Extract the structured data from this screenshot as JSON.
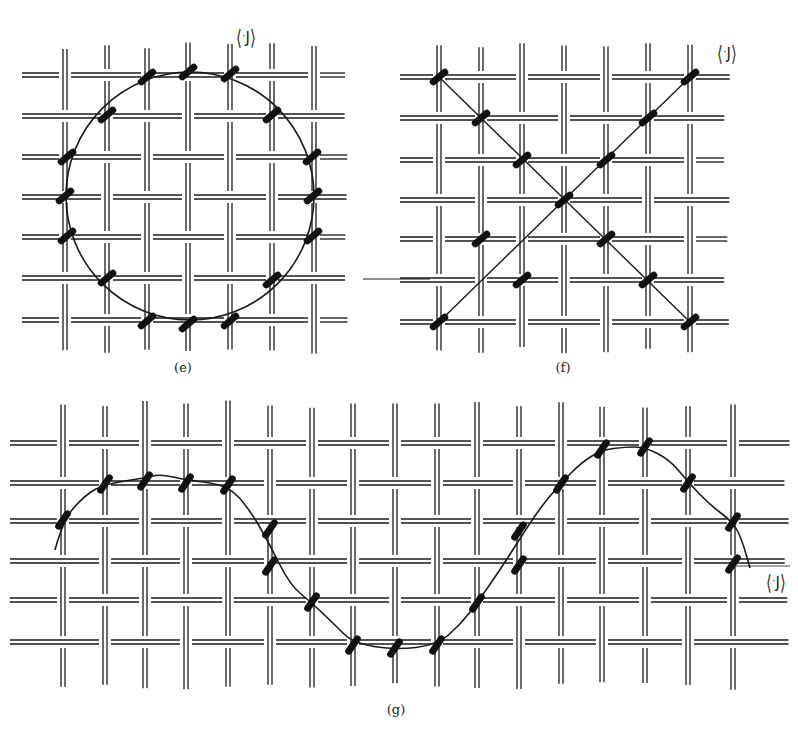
{
  "figure": {
    "colors": {
      "line": "#1a1a1a",
      "stitch": "#111111",
      "background": "#ffffff"
    },
    "panels": [
      {
        "id": "e",
        "caption": "(e)",
        "caption_pos": [
          183,
          370
        ],
        "shape": "circle",
        "path_label": {
          "prefix": "⟨",
          "dot": "·",
          "letter": "J",
          "suffix": "⟩",
          "pos": [
            246,
            38
          ]
        },
        "grid": {
          "vx": [
            65,
            107,
            147,
            188,
            230,
            272,
            314
          ],
          "hy": [
            75,
            116,
            157,
            197,
            237,
            278,
            320
          ],
          "x_range": [
            22,
            348
          ],
          "y_range": [
            42,
            355
          ]
        },
        "curve": {
          "cx": 190,
          "cy": 196,
          "rx": 124,
          "ry": 124
        },
        "stitches": [
          [
            147,
            77
          ],
          [
            188,
            72
          ],
          [
            230,
            74
          ],
          [
            272,
            115
          ],
          [
            312,
            157
          ],
          [
            313,
            196
          ],
          [
            313,
            236
          ],
          [
            272,
            280
          ],
          [
            230,
            321
          ],
          [
            188,
            324
          ],
          [
            147,
            321
          ],
          [
            107,
            278
          ],
          [
            67,
            236
          ],
          [
            65,
            196
          ],
          [
            67,
            157
          ],
          [
            107,
            115
          ]
        ]
      },
      {
        "id": "f",
        "caption": "(f)",
        "caption_pos": [
          563,
          370
        ],
        "shape": "diagonals",
        "path_label": {
          "prefix": "⟨",
          "dot": "·",
          "letter": "J",
          "suffix": "⟩",
          "pos": [
            727,
            54
          ]
        },
        "grid": {
          "vx": [
            439,
            481,
            522,
            564,
            606,
            648,
            690
          ],
          "hy": [
            77,
            118,
            160,
            200,
            239,
            280,
            322
          ],
          "x_range": [
            400,
            730
          ],
          "y_range": [
            42,
            355
          ]
        },
        "lines": [
          {
            "from": [
              439,
              77
            ],
            "to": [
              690,
              322
            ]
          },
          {
            "from": [
              439,
              322
            ],
            "to": [
              690,
              77
            ]
          }
        ],
        "extra_line": {
          "from": [
            363,
            279
          ],
          "to": [
            430,
            279
          ]
        },
        "stitches": [
          [
            439,
            77
          ],
          [
            481,
            118
          ],
          [
            522,
            160
          ],
          [
            564,
            200
          ],
          [
            606,
            239
          ],
          [
            648,
            280
          ],
          [
            690,
            322
          ],
          [
            690,
            77
          ],
          [
            648,
            118
          ],
          [
            606,
            160
          ],
          [
            481,
            239
          ],
          [
            439,
            322
          ],
          [
            522,
            280
          ]
        ]
      },
      {
        "id": "g",
        "caption": "(g)",
        "caption_pos": [
          396,
          712
        ],
        "shape": "sine",
        "path_label": {
          "prefix": "⟨",
          "dot": "·",
          "letter": "J",
          "suffix": "⟩",
          "pos": [
            776,
            583
          ]
        },
        "grid": {
          "vx": [
            63,
            105,
            145,
            186,
            228,
            270,
            312,
            353,
            395,
            437,
            477,
            519,
            561,
            602,
            645,
            688,
            733
          ],
          "hy": [
            443,
            483,
            521,
            561,
            600,
            642
          ],
          "x_range": [
            10,
            790
          ],
          "y_range": [
            400,
            690
          ]
        },
        "curve_points": [
          [
            55,
            550
          ],
          [
            63,
            520
          ],
          [
            85,
            495
          ],
          [
            105,
            484
          ],
          [
            145,
            478
          ],
          [
            160,
            474
          ],
          [
            186,
            480
          ],
          [
            228,
            485
          ],
          [
            250,
            510
          ],
          [
            270,
            545
          ],
          [
            290,
            585
          ],
          [
            312,
            603
          ],
          [
            335,
            625
          ],
          [
            353,
            643
          ],
          [
            395,
            650
          ],
          [
            437,
            645
          ],
          [
            460,
            625
          ],
          [
            477,
            603
          ],
          [
            500,
            570
          ],
          [
            519,
            540
          ],
          [
            540,
            508
          ],
          [
            561,
            483
          ],
          [
            582,
            462
          ],
          [
            602,
            450
          ],
          [
            625,
            447
          ],
          [
            645,
            447
          ],
          [
            670,
            460
          ],
          [
            688,
            482
          ],
          [
            710,
            505
          ],
          [
            733,
            522
          ],
          [
            742,
            540
          ],
          [
            750,
            568
          ]
        ],
        "stitches": [
          [
            63,
            520
          ],
          [
            105,
            484
          ],
          [
            145,
            481
          ],
          [
            186,
            483
          ],
          [
            228,
            485
          ],
          [
            270,
            529
          ],
          [
            270,
            566
          ],
          [
            312,
            602
          ],
          [
            353,
            645
          ],
          [
            395,
            648
          ],
          [
            437,
            645
          ],
          [
            477,
            603
          ],
          [
            519,
            531
          ],
          [
            519,
            565
          ],
          [
            561,
            484
          ],
          [
            602,
            449
          ],
          [
            645,
            447
          ],
          [
            688,
            483
          ],
          [
            733,
            522
          ],
          [
            733,
            564
          ]
        ]
      }
    ]
  }
}
